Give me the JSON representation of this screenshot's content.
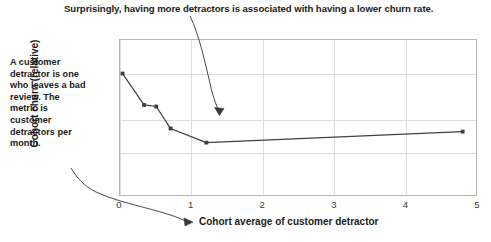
{
  "title": "Surprisingly, having more detractors is associated with having a lower churn rate.",
  "side_note": "A customer detractor is one who leaves a bad review. The metric is customer detractors per month.",
  "colors": {
    "text": "#1b1b1b",
    "line": "#3f3f3f",
    "grid": "#dcdcdc",
    "frame": "#b6b6b6",
    "background": "#ffffff"
  },
  "chart_data": {
    "type": "line",
    "title": "Surprisingly, having more detractors is associated with having a lower churn rate.",
    "xlabel": "Cohort average of customer detractor",
    "ylabel": "Cohort churn (relative)",
    "xlim": [
      0,
      5
    ],
    "ylim": [
      0,
      1
    ],
    "xticks": [
      0,
      1,
      2,
      3,
      4,
      5
    ],
    "xticklabels": [
      "0",
      "1",
      "2",
      "3",
      "4",
      "5"
    ],
    "yticks": [],
    "yticklabels": [],
    "grid": true,
    "legend": false,
    "series": [
      {
        "name": "Cohort churn (relative)",
        "x": [
          0.05,
          0.35,
          0.52,
          0.72,
          1.22,
          4.8
        ],
        "y": [
          0.78,
          0.58,
          0.57,
          0.43,
          0.34,
          0.41
        ],
        "marker": "square",
        "color": "#3f3f3f"
      }
    ],
    "annotations": [
      {
        "name": "title-callout-arrow",
        "text": "Surprisingly, having more detractors is associated with having a lower churn rate.",
        "points_to": [
          1.4,
          0.53
        ]
      },
      {
        "name": "side-note-callout-arrow",
        "text": "A customer detractor is one who leaves a bad review. The metric is customer detractors per month.",
        "points_to_label": "Cohort average of customer detractor"
      }
    ]
  }
}
